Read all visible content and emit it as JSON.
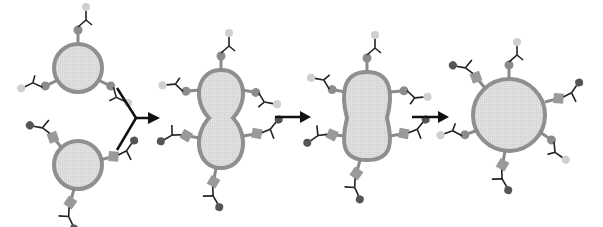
{
  "diagram": {
    "type": "vesicle-fusion-sequence",
    "stages": [
      {
        "id": "vesicle-a",
        "shape": "circle",
        "receptors": "light-circle-tipped"
      },
      {
        "id": "vesicle-b",
        "shape": "circle",
        "receptors": "dark-circle-tipped with square linkers"
      },
      {
        "id": "fusion-neck",
        "shape": "figure-eight"
      },
      {
        "id": "fusion-elongated",
        "shape": "peanut"
      },
      {
        "id": "fused-vesicle",
        "shape": "circle",
        "receptors": "mixed"
      }
    ],
    "arrows": [
      "merge-arrow",
      "arrow-2",
      "arrow-3"
    ],
    "colors": {
      "membrane": "#8f8f8f",
      "lumen": "#dcdcdc",
      "stalk": "#8a8a8a",
      "light_tip": "#cfcfcf",
      "dark_tip": "#555555",
      "linker_circle": "#8c8c8c",
      "linker_square": "#9a9a9a",
      "antenna": "#222222",
      "arrow": "#111111"
    }
  }
}
